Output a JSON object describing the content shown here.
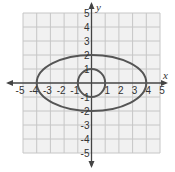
{
  "figure": {
    "axis_labels": {
      "x": "x",
      "y": "y"
    },
    "x_ticks": [
      "-5",
      "-4",
      "-3",
      "-2",
      "-1",
      "1",
      "2",
      "3",
      "4",
      "5"
    ],
    "y_ticks": [
      "5",
      "4",
      "3",
      "2",
      "1",
      "-1",
      "-2",
      "-3",
      "-4",
      "-5"
    ],
    "range": {
      "xmin": -5,
      "xmax": 5,
      "ymin": -5,
      "ymax": 5
    },
    "grid": true,
    "curves": [
      {
        "name": "ellipse",
        "center": [
          0,
          0
        ],
        "rx": 4,
        "ry": 2,
        "color": "#555555"
      },
      {
        "name": "circle",
        "center": [
          0,
          0
        ],
        "rx": 1,
        "ry": 1,
        "color": "#555555"
      }
    ],
    "colors": {
      "grid": "#c8c8c8",
      "grid_bg": "#f0f0f0",
      "axis": "#444444",
      "curve": "#555555"
    }
  }
}
